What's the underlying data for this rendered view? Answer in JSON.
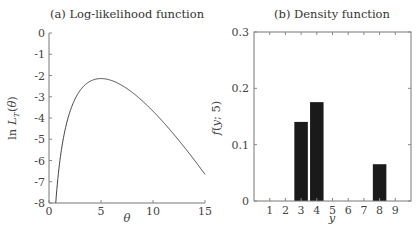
{
  "chart_data": [
    {
      "type": "line",
      "title": "(a) Log-likelihood function",
      "xlabel": "θ",
      "ylabel": "ln L_T(θ)",
      "xlim": [
        0,
        15
      ],
      "ylim": [
        -8,
        0
      ],
      "xticks": [
        0,
        5,
        10,
        15
      ],
      "yticks": [
        0,
        -1,
        -2,
        -3,
        -4,
        -5,
        -6,
        -7,
        -8
      ],
      "grid": false,
      "function": "ln L_T(θ) = 5 ln θ − θ − 5.1915 (mean Poisson log-likelihood, sample y = {3,4,8})",
      "series": [
        {
          "name": "ln L_T(θ)",
          "x": [
            0.65,
            0.8,
            1,
            1.5,
            2,
            2.5,
            3,
            3.5,
            4,
            4.5,
            5,
            6,
            7,
            8,
            9,
            10,
            11,
            12,
            13,
            14,
            15
          ],
          "y": [
            -7.99,
            -7.11,
            -6.19,
            -4.67,
            -3.73,
            -3.11,
            -2.7,
            -2.43,
            -2.26,
            -2.17,
            -2.14,
            -2.23,
            -2.46,
            -2.79,
            -3.21,
            -3.68,
            -4.2,
            -4.77,
            -5.37,
            -6.0,
            -6.65
          ]
        }
      ],
      "annotations": []
    },
    {
      "type": "bar",
      "title": "(b) Density function",
      "xlabel": "y",
      "ylabel": "f(y; 5)",
      "xlim": [
        0,
        10
      ],
      "ylim": [
        0,
        0.3
      ],
      "categories": [
        1,
        2,
        3,
        4,
        5,
        6,
        7,
        8,
        9
      ],
      "yticks": [
        0,
        0.1,
        0.2,
        0.3
      ],
      "ytick_labels": [
        "0",
        "0.1",
        "0.2",
        "0.3"
      ],
      "values": [
        0,
        0,
        0.1404,
        0.1755,
        0,
        0,
        0,
        0.0653,
        0
      ],
      "grid": false,
      "legend": null
    }
  ]
}
